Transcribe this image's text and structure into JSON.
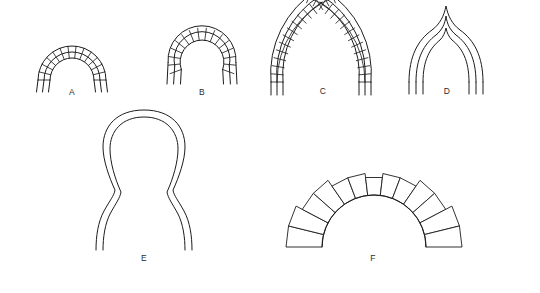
{
  "plate": {
    "title": "Arch Types",
    "background_color": "#ffffff",
    "line_color": "#1c1c1c",
    "label_color": "#2b2b2b",
    "width": 540,
    "height": 293
  },
  "figures": [
    {
      "id": "a",
      "label": "A",
      "name": "semicircular-arch",
      "description": "Round (semicircular) arch with two concentric rings of voussoirs",
      "voussoir_count": 13,
      "ring_count": 2,
      "center_x": 72,
      "center_y": 80,
      "inner_radius": 22,
      "outer_radius": 34,
      "has_voussoirs": true,
      "start_angle_deg": 180,
      "end_angle_deg": 0
    },
    {
      "id": "b",
      "label": "B",
      "name": "horseshoe-arch",
      "description": "Horseshoe arch, springing carried below the impost line, with voussoirs",
      "voussoir_count": 15,
      "ring_count": 2,
      "center_x": 202,
      "center_y": 62,
      "inner_radius": 22,
      "outer_radius": 34,
      "has_voussoirs": true,
      "start_angle_deg": 200,
      "end_angle_deg": -20
    },
    {
      "id": "c",
      "label": "C",
      "name": "pointed-lancet-arch",
      "description": "Tall pointed lancet arch built of two curved limbs of voussoirs",
      "voussoir_count": 14,
      "ring_count": 2,
      "has_voussoirs": true
    },
    {
      "id": "d",
      "label": "D",
      "name": "ogee-arch",
      "description": "Ogee arch drawn in triple outline with reverse-curve apex, no voussoirs",
      "outline_count": 3,
      "has_voussoirs": false
    },
    {
      "id": "e",
      "label": "E",
      "name": "keel-onion-arch",
      "description": "Keel / onion arch in double outline with flared stilted jambs",
      "outline_count": 2,
      "has_voussoirs": false
    },
    {
      "id": "f",
      "label": "F",
      "name": "stepped-extrados-arch",
      "description": "Round arch with radiating wedge voussoirs and a stepped (corbelled) extrados",
      "voussoir_count": 13,
      "has_voussoirs": true,
      "stepped_extrados": true
    }
  ]
}
